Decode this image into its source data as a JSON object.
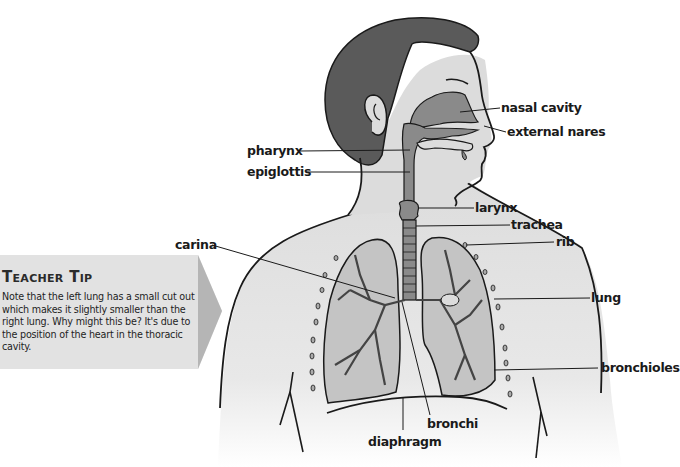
{
  "figure": {
    "labels": {
      "nasal_cavity": "nasal cavity",
      "external_nares": "external nares",
      "pharynx": "pharynx",
      "epiglottis": "epiglottis",
      "larynx": "larynx",
      "trachea": "trachea",
      "rib": "rib",
      "carina": "carina",
      "lung": "lung",
      "bronchioles": "bronchioles",
      "bronchi": "bronchi",
      "diaphragm": "diaphragm"
    },
    "colors": {
      "skin": "#dcdcdc",
      "hair": "#5a5a5a",
      "airway": "#8a8a8a",
      "lung_fill": "#c4c4c4",
      "outline": "#1a1a1a",
      "tip_box": "#e2e2e2",
      "tip_arrow": "#b5b5b5"
    }
  },
  "teacher_tip": {
    "title": "Teacher Tip",
    "body": "Note that the left lung has a small cut out which makes it slightly smaller than the right lung. Why might this be? It's due to the position of the heart in the thoracic cavity."
  }
}
